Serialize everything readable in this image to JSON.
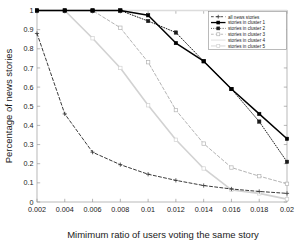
{
  "chart_data": {
    "type": "line",
    "title": "",
    "xlabel": "Mimimum ratio of users voting the same story",
    "ylabel": "Percentage of news stories",
    "xlim": [
      0.002,
      0.02
    ],
    "ylim": [
      0,
      1
    ],
    "grid": false,
    "legend_position": "top-right",
    "x": [
      0.002,
      0.004,
      0.006,
      0.008,
      0.01,
      0.012,
      0.014,
      0.016,
      0.018,
      0.02
    ],
    "xticklabels": [
      "0.002",
      "0.004",
      "0.006",
      "0.008",
      "0.01",
      "0.012",
      "0.014",
      "0.016",
      "0.018",
      "0.02"
    ],
    "yticklabels": [
      "0",
      "0.1",
      "0.2",
      "0.3",
      "0.4",
      "0.5",
      "0.6",
      "0.7",
      "0.8",
      "0.9",
      "1"
    ],
    "yticks": [
      0,
      0.1,
      0.2,
      0.3,
      0.4,
      0.5,
      0.6,
      0.7,
      0.8,
      0.9,
      1
    ],
    "series": [
      {
        "name": "all news stories",
        "color": "#3a3a3a",
        "linestyle": "dashed",
        "marker": "plus",
        "values": [
          0.88,
          0.46,
          0.26,
          0.195,
          0.145,
          0.113,
          0.086,
          0.068,
          0.055,
          0.045
        ]
      },
      {
        "name": "stories in cluster 1",
        "color": "#000000",
        "linestyle": "solid",
        "marker": "square-filled",
        "values": [
          1.0,
          1.0,
          1.0,
          1.0,
          0.975,
          0.83,
          0.735,
          0.59,
          0.46,
          0.33
        ]
      },
      {
        "name": "stories in cluster 2",
        "color": "#1c1c1c",
        "linestyle": "dotted",
        "marker": "square-filled",
        "values": [
          1.0,
          1.0,
          1.0,
          1.0,
          0.945,
          0.885,
          0.735,
          0.59,
          0.42,
          0.21
        ]
      },
      {
        "name": "stories in cluster 3",
        "color": "#b4b4b4",
        "linestyle": "dashed",
        "marker": "square-open",
        "values": [
          1.0,
          1.0,
          1.0,
          0.91,
          0.73,
          0.48,
          0.305,
          0.18,
          0.135,
          0.095
        ]
      },
      {
        "name": "stories in cluster 4",
        "color": "#dcdcdc",
        "linestyle": "solid",
        "marker": "none",
        "values": [
          1.0,
          1.0,
          1.0,
          1.0,
          1.0,
          1.0,
          1.0,
          1.0,
          1.0,
          1.0
        ]
      },
      {
        "name": "stories in cluster 5",
        "color": "#d2d2d2",
        "linestyle": "solid",
        "marker": "square-open",
        "values": [
          1.0,
          1.0,
          0.855,
          0.7,
          0.505,
          0.325,
          0.175,
          0.063,
          0.045,
          0.015
        ]
      }
    ],
    "legend": [
      "all news stories",
      "stories in cluster 1",
      "stories in cluster 2",
      "stories in cluster 3",
      "stories in cluster 4",
      "stories in cluster 5"
    ]
  }
}
